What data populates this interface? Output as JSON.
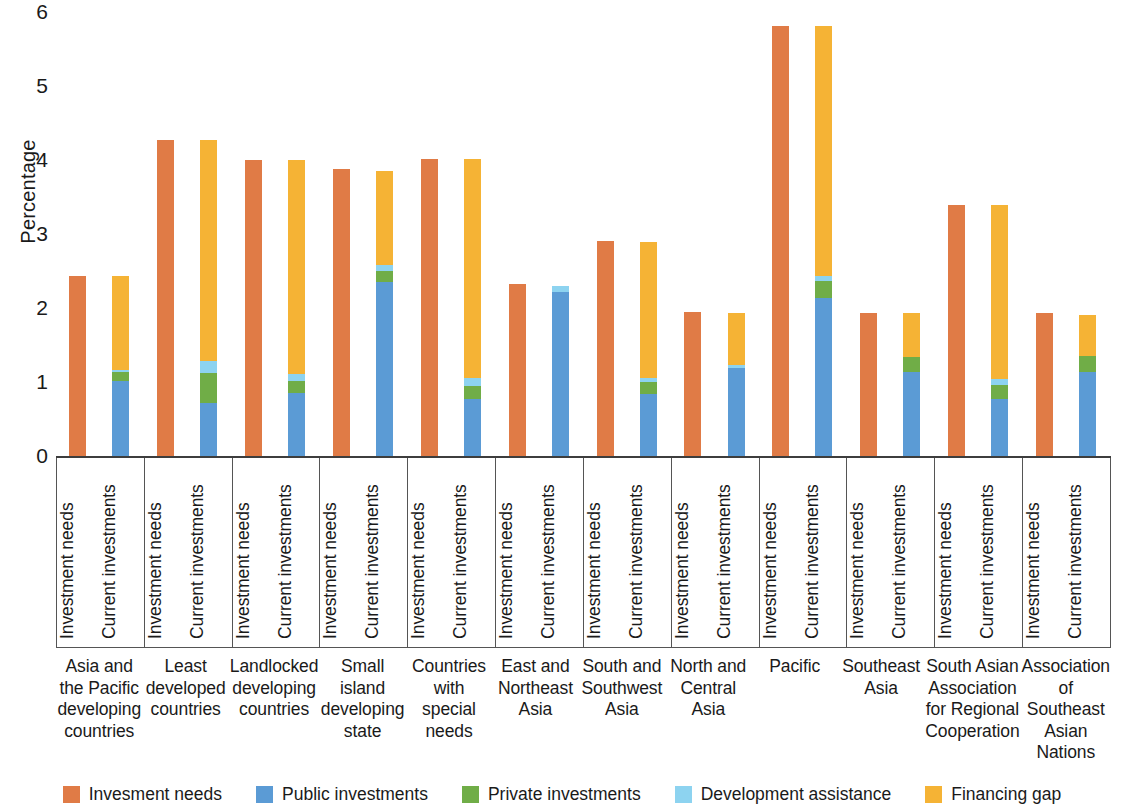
{
  "chart_data": {
    "type": "bar",
    "title": "",
    "subtitle": "",
    "xlabel": "",
    "ylabel": "Percentage",
    "ylim": [
      0,
      6
    ],
    "yticks": [
      0,
      1,
      2,
      3,
      4,
      5,
      6
    ],
    "grid": false,
    "stacked": true,
    "legend_position": "bottom",
    "bar_sublabels": [
      "Investment needs",
      "Current investments"
    ],
    "series": [
      {
        "name": "Invesment needs",
        "color": "#E07B46"
      },
      {
        "name": "Public investments",
        "color": "#5B9BD5"
      },
      {
        "name": "Private investments",
        "color": "#70AD47"
      },
      {
        "name": "Development assistance",
        "color": "#8DD3F0"
      },
      {
        "name": "Financing gap",
        "color": "#F5B335"
      }
    ],
    "categories": [
      "Asia and the Pacific developing countries",
      "Least developed countries",
      "Landlocked developing countries",
      "Small island developing state",
      "Countries with special needs",
      "East and Northeast Asia",
      "South and Southwest Asia",
      "North and Central Asia",
      "Pacific",
      "Southeast Asia",
      "South Asian Association for Regional Cooperation",
      "Association of Southeast Asian Nations"
    ],
    "groups": [
      {
        "category": "Asia and the Pacific developing countries",
        "investment_needs": 2.44,
        "current_investments": {
          "public": 1.03,
          "private": 0.12,
          "development_assistance": 0.03,
          "financing_gap": 1.26,
          "total": 2.44
        }
      },
      {
        "category": "Least developed countries",
        "investment_needs": 4.28,
        "current_investments": {
          "public": 0.73,
          "private": 0.4,
          "development_assistance": 0.17,
          "financing_gap": 2.98,
          "total": 4.28
        }
      },
      {
        "category": "Landlocked developing countries",
        "investment_needs": 4.01,
        "current_investments": {
          "public": 0.86,
          "private": 0.17,
          "development_assistance": 0.09,
          "financing_gap": 2.89,
          "total": 4.01
        }
      },
      {
        "category": "Small island developing state",
        "investment_needs": 3.89,
        "current_investments": {
          "public": 2.37,
          "private": 0.15,
          "development_assistance": 0.08,
          "financing_gap": 1.27,
          "total": 3.87
        }
      },
      {
        "category": "Countries with special needs",
        "investment_needs": 4.03,
        "current_investments": {
          "public": 0.78,
          "private": 0.18,
          "development_assistance": 0.11,
          "financing_gap": 2.96,
          "total": 4.03
        }
      },
      {
        "category": "East and Northeast Asia",
        "investment_needs": 2.34,
        "current_investments": {
          "public": 2.23,
          "private": 0.0,
          "development_assistance": 0.08,
          "financing_gap": 0.0,
          "total": 2.31
        }
      },
      {
        "category": "South and Southwest Asia",
        "investment_needs": 2.92,
        "current_investments": {
          "public": 0.85,
          "private": 0.17,
          "development_assistance": 0.05,
          "financing_gap": 1.83,
          "total": 2.9
        }
      },
      {
        "category": "North and Central Asia",
        "investment_needs": 1.96,
        "current_investments": {
          "public": 1.2,
          "private": 0.0,
          "development_assistance": 0.05,
          "financing_gap": 0.69,
          "total": 1.94
        }
      },
      {
        "category": "Pacific",
        "investment_needs": 5.82,
        "current_investments": {
          "public": 2.15,
          "private": 0.23,
          "development_assistance": 0.07,
          "financing_gap": 3.37,
          "total": 5.82
        }
      },
      {
        "category": "Southeast Asia",
        "investment_needs": 1.95,
        "current_investments": {
          "public": 1.15,
          "private": 0.2,
          "development_assistance": 0.0,
          "financing_gap": 0.59,
          "total": 1.94
        }
      },
      {
        "category": "South Asian Association for Regional Cooperation",
        "investment_needs": 3.41,
        "current_investments": {
          "public": 0.78,
          "private": 0.19,
          "development_assistance": 0.08,
          "financing_gap": 2.35,
          "total": 3.4
        }
      },
      {
        "category": "Association of Southeast Asian Nations",
        "investment_needs": 1.94,
        "current_investments": {
          "public": 1.15,
          "private": 0.21,
          "development_assistance": 0.0,
          "financing_gap": 0.56,
          "total": 1.92
        }
      }
    ]
  },
  "axis": {
    "ylabel": "Percentage",
    "yticks": [
      "0",
      "1",
      "2",
      "3",
      "4",
      "5",
      "6"
    ]
  },
  "sublabels": {
    "needs": "Investment needs",
    "current": "Current investments"
  },
  "category_lines": [
    [
      "Asia and",
      "the Pacific",
      "developing",
      "countries"
    ],
    [
      "Least",
      "developed",
      "countries"
    ],
    [
      "Landlocked",
      "developing",
      "countries"
    ],
    [
      "Small",
      "island",
      "developing",
      "state"
    ],
    [
      "Countries",
      "with special",
      "needs"
    ],
    [
      "East and",
      "Northeast",
      "Asia"
    ],
    [
      "South and",
      "Southwest",
      "Asia"
    ],
    [
      "North and",
      "Central Asia"
    ],
    [
      "Pacific"
    ],
    [
      "Southeast",
      "Asia"
    ],
    [
      "South Asian",
      "Association",
      "for Regional",
      "Cooperation"
    ],
    [
      "Association",
      "of Southeast",
      "Asian",
      "Nations"
    ]
  ],
  "legend": {
    "items": [
      {
        "label": "Invesment needs",
        "color": "#E07B46"
      },
      {
        "label": "Public investments",
        "color": "#5B9BD5"
      },
      {
        "label": "Private investments",
        "color": "#70AD47"
      },
      {
        "label": "Development assistance",
        "color": "#8DD3F0"
      },
      {
        "label": "Financing gap",
        "color": "#F5B335"
      }
    ]
  },
  "colors": {
    "investment_needs": "#E07B46",
    "public": "#5B9BD5",
    "private": "#70AD47",
    "development_assistance": "#8DD3F0",
    "financing_gap": "#F5B335",
    "axis": "#3d3d3d",
    "text": "#1a1a1a"
  }
}
